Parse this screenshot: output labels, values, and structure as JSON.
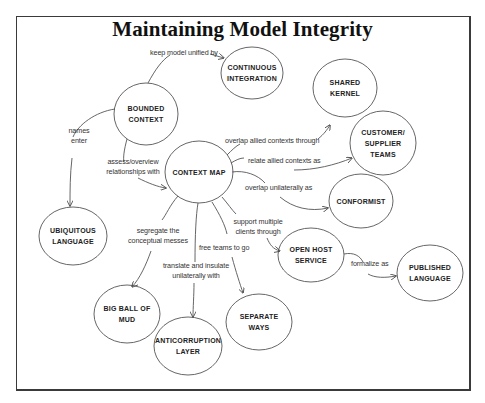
{
  "diagram": {
    "title": "Maintaining Model Integrity",
    "nodes": {
      "bounded_context": {
        "line1": "Bounded",
        "line2": "Context"
      },
      "continuous_integration": {
        "line1": "Continuous",
        "line2": "Integration"
      },
      "shared_kernel": {
        "line1": "Shared",
        "line2": "Kernel"
      },
      "customer_supplier": {
        "line1": "Customer/",
        "line2": "Supplier",
        "line3": "Teams"
      },
      "context_map": {
        "line1": "Context Map"
      },
      "conformist": {
        "line1": "Conformist"
      },
      "ubiquitous_language": {
        "line1": "Ubiquitous",
        "line2": "Language"
      },
      "open_host_service": {
        "line1": "Open Host",
        "line2": "Service"
      },
      "published_language": {
        "line1": "Published",
        "line2": "Language"
      },
      "big_ball_of_mud": {
        "line1": "Big Ball of",
        "line2": "Mud"
      },
      "anticorruption_layer": {
        "line1": "Anticorruption",
        "line2": "Layer"
      },
      "separate_ways": {
        "line1": "Separate",
        "line2": "Ways"
      }
    },
    "edges": {
      "keep_unified": "keep model unified by",
      "names_enter_1": "names",
      "names_enter_2": "enter",
      "assess_1": "assess/overview",
      "assess_2": "relationships with",
      "overlap_allied": "overlap allied contexts through",
      "relate_allied": "relate allied contexts as",
      "overlap_unilaterally": "overlap unilaterally as",
      "support_multiple_1": "support multiple",
      "support_multiple_2": "clients through",
      "formalize": "formalize as",
      "segregate_1": "segregate the",
      "segregate_2": "conceptual messes",
      "free_teams": "free teams to go",
      "translate_1": "translate and insulate",
      "translate_2": "unilaterally with"
    }
  }
}
